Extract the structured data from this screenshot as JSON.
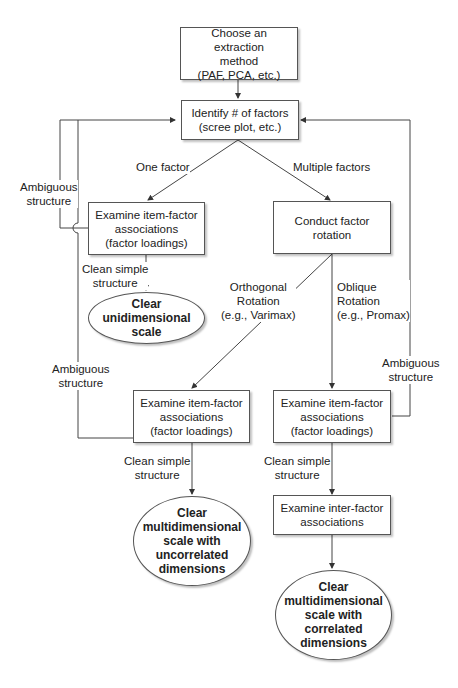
{
  "nodes": {
    "extraction": "Choose an extraction\nmethod\n(PAF, PCA, etc.)",
    "identify": "Identify # of factors\n(scree plot, etc.)",
    "examine_one": "Examine item-factor\nassociations\n(factor loadings)",
    "rotation": "Conduct factor\nrotation",
    "clear_uni": "Clear\nunidimensional\nscale",
    "examine_orth": "Examine item-factor\nassociations\n(factor loadings)",
    "examine_obl": "Examine item-factor\nassociations\n(factor loadings)",
    "clear_uncorr": "Clear\nmultidimensional\nscale with\nuncorrelated\ndimensions",
    "inter_factor": "Examine inter-factor\nassociations",
    "clear_corr": "Clear\nmultidimensional\nscale with\ncorrelated\ndimensions"
  },
  "edges": {
    "one_factor": "One factor",
    "multiple_factors": "Multiple factors",
    "ambiguous_1": "Ambiguous\nstructure",
    "clean_1": "Clean simple\nstructure",
    "orthogonal": "Orthogonal\nRotation\n(e.g., Varimax)",
    "oblique": "Oblique\nRotation\n(e.g., Promax)",
    "ambiguous_2": "Ambiguous\nstructure",
    "ambiguous_3": "Ambiguous\nstructure",
    "clean_2": "Clean simple\nstructure",
    "clean_3": "Clean simple\nstructure"
  }
}
